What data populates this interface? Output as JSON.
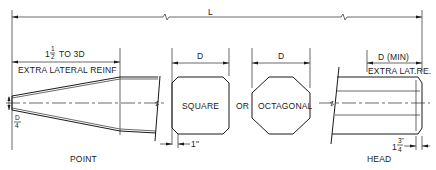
{
  "diagram": {
    "labels": {
      "overall_length": "L",
      "point_reinf_length_whole": "1",
      "point_reinf_length_num": "1",
      "point_reinf_length_den": "2",
      "point_reinf_length_rest": "TO 3D",
      "point_reinf_note": "EXTRA LATERAL REINF",
      "square_dim": "D",
      "octagonal_dim": "D",
      "head_dim": "D (MIN)",
      "head_reinf_note": "EXTRA LAT.RE.",
      "tip_num": "D",
      "tip_den": "4",
      "square_label": "SQUARE",
      "or_label": "OR",
      "octagonal_label": "OCTAGONAL",
      "chamfer_dim": "1\"",
      "head_chamfer_whole": "1",
      "head_chamfer_num": "3\"",
      "head_chamfer_den": "4",
      "point_caption": "POINT",
      "head_caption": "HEAD"
    }
  }
}
